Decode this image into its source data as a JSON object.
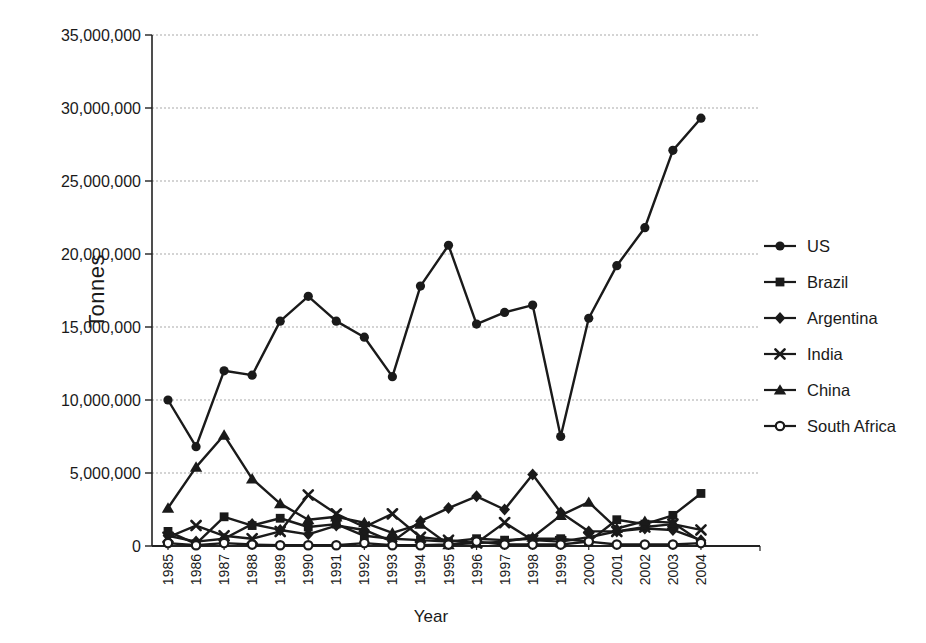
{
  "figure": {
    "background": "#ffffff",
    "line_color": "#1a1a1a",
    "grid_color": "#a9a9a9",
    "axis_color": "#222222",
    "text_color": "#1a1a1a"
  },
  "chart_data": {
    "type": "line",
    "title": "",
    "xlabel": "Year",
    "ylabel": "Tonnes",
    "grid": true,
    "legend_position": "right",
    "ylim": [
      0,
      35000000
    ],
    "y_tick_step": 5000000,
    "y_tick_labels": [
      "0",
      "5,000,000",
      "10,000,000",
      "15,000,000",
      "20,000,000",
      "25,000,000",
      "30,000,000",
      "35,000,000"
    ],
    "categories": [
      1985,
      1986,
      1987,
      1988,
      1989,
      1990,
      1991,
      1992,
      1993,
      1994,
      1995,
      1996,
      1997,
      1998,
      1999,
      2000,
      2001,
      2002,
      2003,
      2004
    ],
    "series": [
      {
        "name": "US",
        "marker": "circle",
        "values": [
          10000000,
          6800000,
          12000000,
          11700000,
          15400000,
          17100000,
          15400000,
          14300000,
          11600000,
          17800000,
          20600000,
          15200000,
          16000000,
          16500000,
          7500000,
          15600000,
          19200000,
          21800000,
          27100000,
          29300000
        ]
      },
      {
        "name": "Brazil",
        "marker": "square",
        "values": [
          1000000,
          150000,
          2000000,
          1400000,
          1900000,
          1300000,
          1500000,
          700000,
          500000,
          400000,
          300000,
          500000,
          400000,
          500000,
          500000,
          300000,
          1800000,
          1500000,
          2100000,
          3600000
        ]
      },
      {
        "name": "Argentina",
        "marker": "diamond",
        "values": [
          700000,
          300000,
          500000,
          1500000,
          1100000,
          800000,
          1400000,
          1100000,
          300000,
          1700000,
          2600000,
          3400000,
          2500000,
          4900000,
          2300000,
          1000000,
          1000000,
          1200000,
          1100000,
          400000
        ]
      },
      {
        "name": "India",
        "marker": "x",
        "values": [
          600000,
          1400000,
          700000,
          500000,
          1000000,
          3500000,
          2200000,
          1300000,
          2200000,
          600000,
          400000,
          200000,
          1600000,
          400000,
          300000,
          600000,
          1000000,
          1300000,
          1500000,
          1100000
        ]
      },
      {
        "name": "China",
        "marker": "triangle",
        "values": [
          2600000,
          5400000,
          7600000,
          4600000,
          2900000,
          1800000,
          2000000,
          1600000,
          900000,
          1500000,
          100000,
          200000,
          300000,
          600000,
          2100000,
          3000000,
          1200000,
          1700000,
          1600000,
          300000
        ]
      },
      {
        "name": "South Africa",
        "marker": "circle-open",
        "values": [
          200000,
          50000,
          200000,
          100000,
          50000,
          50000,
          50000,
          200000,
          50000,
          50000,
          100000,
          300000,
          100000,
          100000,
          100000,
          300000,
          100000,
          100000,
          100000,
          200000
        ]
      }
    ]
  }
}
